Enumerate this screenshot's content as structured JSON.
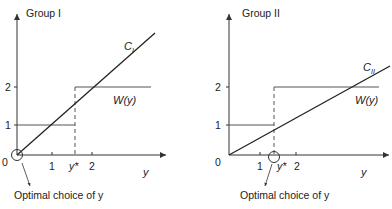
{
  "panels": [
    {
      "title": "Group I",
      "cost_label": "C",
      "cost_sub": "I",
      "w_label": "W(y)",
      "x_label": "y",
      "origin_label": "0",
      "x_ticks": [
        "1",
        "y*",
        "2"
      ],
      "y_ticks": [
        "1",
        "2"
      ],
      "annotation": "Optimal choice of y"
    },
    {
      "title": "Group II",
      "cost_label": "C",
      "cost_sub": "II",
      "w_label": "W(y)",
      "x_label": "y",
      "origin_label": "0",
      "x_ticks": [
        "1",
        "y*",
        "2"
      ],
      "y_ticks": [
        "1",
        "2"
      ],
      "annotation": "Optimal choice of y"
    }
  ]
}
